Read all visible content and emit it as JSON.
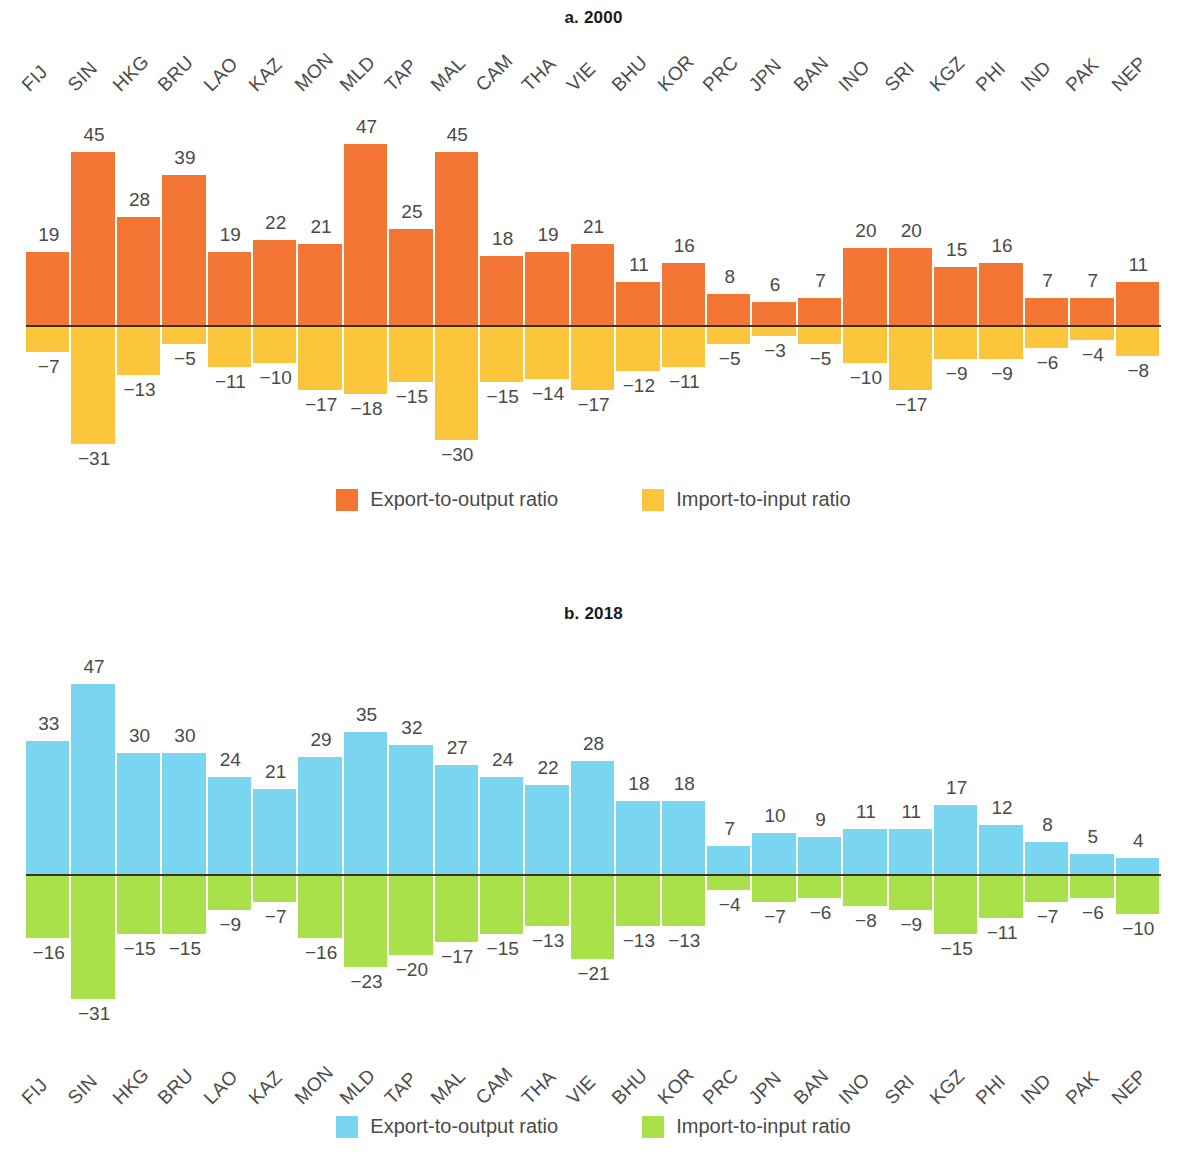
{
  "figure": {
    "panels": [
      {
        "id": "a",
        "prefix": "a.",
        "title": "2000",
        "full_title": "a. 2000",
        "axis_position": "top",
        "legend": [
          {
            "label": "Export-to-output ratio",
            "color": "#F47634",
            "icon": "legend-swatch-orange"
          },
          {
            "label": "Import-to-input ratio",
            "color": "#FBC53C",
            "icon": "legend-swatch-yellow"
          }
        ]
      },
      {
        "id": "b",
        "prefix": "b.",
        "title": "2018",
        "full_title": "b. 2018",
        "axis_position": "bottom",
        "legend": [
          {
            "label": "Export-to-output ratio",
            "color": "#79D5F0",
            "icon": "legend-swatch-blue"
          },
          {
            "label": "Import-to-input ratio",
            "color": "#A8E14A",
            "icon": "legend-swatch-green"
          }
        ]
      }
    ]
  },
  "chart_data": [
    {
      "type": "bar",
      "title": "a. 2000",
      "xlabel": "",
      "ylabel": "",
      "grid": false,
      "legend_position": "bottom",
      "ylim": [
        -35,
        50
      ],
      "categories": [
        "FIJ",
        "SIN",
        "HKG",
        "BRU",
        "LAO",
        "KAZ",
        "MON",
        "MLD",
        "TAP",
        "MAL",
        "CAM",
        "THA",
        "VIE",
        "BHU",
        "KOR",
        "PRC",
        "JPN",
        "BAN",
        "INO",
        "SRI",
        "KGZ",
        "PHI",
        "IND",
        "PAK",
        "NEP"
      ],
      "series": [
        {
          "name": "Export-to-output ratio",
          "color": "#F47634",
          "values": [
            19,
            45,
            28,
            39,
            19,
            22,
            21,
            47,
            25,
            45,
            18,
            19,
            21,
            11,
            16,
            8,
            6,
            7,
            20,
            20,
            15,
            16,
            7,
            7,
            11
          ],
          "labels": [
            "19",
            "45",
            "28",
            "39",
            "19",
            "22",
            "21",
            "47",
            "25",
            "45",
            "18",
            "19",
            "21",
            "11",
            "16",
            "8",
            "6",
            "7",
            "20",
            "20",
            "15",
            "16",
            "7",
            "7",
            "11"
          ]
        },
        {
          "name": "Import-to-input ratio",
          "color": "#FBC53C",
          "values": [
            -7,
            -31,
            -13,
            -5,
            -11,
            -10,
            -17,
            -18,
            -15,
            -30,
            -15,
            -14,
            -17,
            -12,
            -11,
            -5,
            -3,
            -5,
            -10,
            -17,
            -9,
            -9,
            -6,
            -4,
            -8
          ],
          "labels": [
            "−7",
            "−31",
            "−13",
            "−5",
            "−11",
            "−10",
            "−17",
            "−18",
            "−15",
            "−30",
            "−15",
            "−14",
            "−17",
            "−12",
            "−11",
            "−5",
            "−3",
            "−5",
            "−10",
            "−17",
            "−9",
            "−9",
            "−6",
            "−4",
            "−8"
          ]
        }
      ]
    },
    {
      "type": "bar",
      "title": "b. 2018",
      "xlabel": "",
      "ylabel": "",
      "grid": false,
      "legend_position": "bottom",
      "ylim": [
        -35,
        50
      ],
      "categories": [
        "FIJ",
        "SIN",
        "HKG",
        "BRU",
        "LAO",
        "KAZ",
        "MON",
        "MLD",
        "TAP",
        "MAL",
        "CAM",
        "THA",
        "VIE",
        "BHU",
        "KOR",
        "PRC",
        "JPN",
        "BAN",
        "INO",
        "SRI",
        "KGZ",
        "PHI",
        "IND",
        "PAK",
        "NEP"
      ],
      "series": [
        {
          "name": "Export-to-output ratio",
          "color": "#79D5F0",
          "values": [
            33,
            47,
            30,
            30,
            24,
            21,
            29,
            35,
            32,
            27,
            24,
            22,
            28,
            18,
            18,
            7,
            10,
            9,
            11,
            11,
            17,
            12,
            8,
            5,
            4
          ],
          "labels": [
            "33",
            "47",
            "30",
            "30",
            "24",
            "21",
            "29",
            "35",
            "32",
            "27",
            "24",
            "22",
            "28",
            "18",
            "18",
            "7",
            "10",
            "9",
            "11",
            "11",
            "17",
            "12",
            "8",
            "5",
            "4"
          ]
        },
        {
          "name": "Import-to-input ratio",
          "color": "#A8E14A",
          "values": [
            -16,
            -31,
            -15,
            -15,
            -9,
            -7,
            -16,
            -23,
            -20,
            -17,
            -15,
            -13,
            -21,
            -13,
            -13,
            -4,
            -7,
            -6,
            -8,
            -9,
            -15,
            -11,
            -7,
            -6,
            -10
          ],
          "labels": [
            "−16",
            "−31",
            "−15",
            "−15",
            "−9",
            "−7",
            "−16",
            "−23",
            "−20",
            "−17",
            "−15",
            "−13",
            "−21",
            "−13",
            "−13",
            "−4",
            "−7",
            "−6",
            "−8",
            "−9",
            "−15",
            "−11",
            "−7",
            "−6",
            "−10"
          ]
        }
      ]
    }
  ]
}
